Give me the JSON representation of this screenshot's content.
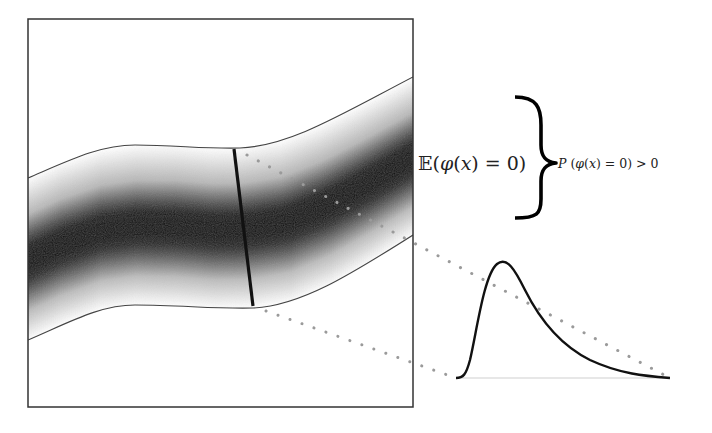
{
  "figure": {
    "colors": {
      "border": "#333333",
      "band_edge": "#444444",
      "band_core": "#000000",
      "band_fade": "#ffffff",
      "cross_section": "#111111",
      "dots": "#9a9a9a",
      "curve": "#111111",
      "baseline": "#cccccc",
      "brace": "#000000"
    }
  },
  "labels": {
    "expectation": {
      "prefix": "𝔼(",
      "phi": "φ",
      "open": "(",
      "x": "x",
      "rest": ") = 0)"
    },
    "probability": {
      "P": "P",
      "open": " (",
      "phi": "φ",
      "open2": "(",
      "x": "x",
      "rest": ") = 0) > 0"
    }
  },
  "expectation_full": "𝔼(φ(x) = 0)",
  "probability_full": "P (φ(x) = 0) > 0"
}
